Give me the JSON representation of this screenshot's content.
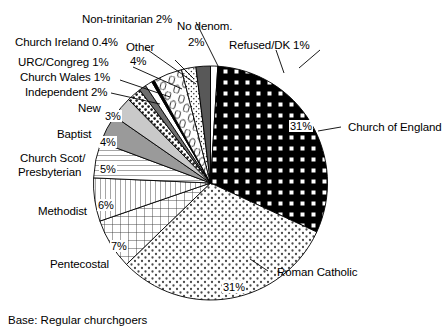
{
  "chart_data": {
    "type": "pie",
    "title": "",
    "subtitle": "",
    "caption": "Base: Regular churchgoers",
    "xlabel": "",
    "ylabel": "",
    "legend_position": "callout-labels",
    "grid": false,
    "total_percent": 100,
    "start_angle_deg": 0,
    "direction": "clockwise",
    "categories": [
      "Refused/DK",
      "Church of England",
      "Roman Catholic",
      "Pentecostal",
      "Methodist",
      "Church Scot/ Presbyterian",
      "Baptist",
      "New",
      "Independent",
      "Church Wales",
      "URC/Congreg",
      "Church Ireland",
      "Other",
      "Non-trinitarian",
      "No denom."
    ],
    "values": [
      1,
      31,
      31,
      7,
      6,
      5,
      4,
      3,
      2,
      1,
      1,
      0.4,
      4,
      2,
      2
    ],
    "value_labels": [
      "1%",
      "31%",
      "31%",
      "7%",
      "6%",
      "5%",
      "4%",
      "3%",
      "2%",
      "1%",
      "1%",
      "0.4%",
      "4%",
      "2%",
      "2%"
    ],
    "slices": [
      {
        "name": "Refused/DK",
        "value": 1,
        "label": "Refused/DK 1%",
        "pct_text": "1%",
        "pattern": "white",
        "fill": "#ffffff"
      },
      {
        "name": "Church of England",
        "value": 31,
        "label": "Church of England",
        "pct_text": "31%",
        "pattern": "black-white-squares",
        "fill": "#000000"
      },
      {
        "name": "Roman Catholic",
        "value": 31,
        "label": "Roman Catholic",
        "pct_text": "31%",
        "pattern": "stipple-dots",
        "fill": "#ffffff"
      },
      {
        "name": "Pentecostal",
        "value": 7,
        "label": "Pentecostal",
        "pct_text": "7%",
        "pattern": "cross-hatch",
        "fill": "#ffffff"
      },
      {
        "name": "Methodist",
        "value": 6,
        "label": "Methodist",
        "pct_text": "6%",
        "pattern": "vertical-lines",
        "fill": "#ffffff"
      },
      {
        "name": "Church Scot/ Presbyterian",
        "value": 5,
        "label": "Church Scot/ Presbyterian",
        "pct_text": "5%",
        "pattern": "horizontal-lines",
        "fill": "#ffffff"
      },
      {
        "name": "Baptist",
        "value": 4,
        "label": "Baptist",
        "pct_text": "4%",
        "pattern": "solid-grey",
        "fill": "#9a9a9a"
      },
      {
        "name": "New",
        "value": 3,
        "label": "New",
        "pct_text": "3%",
        "pattern": "solid-light-grey",
        "fill": "#c9c9c9"
      },
      {
        "name": "Independent",
        "value": 2,
        "label": "Independent 2%",
        "pct_text": "2%",
        "pattern": "coarse-dots",
        "fill": "#ffffff"
      },
      {
        "name": "Church Wales",
        "value": 1,
        "label": "Church Wales 1%",
        "pct_text": "1%",
        "pattern": "solid-dark-grey",
        "fill": "#6e6e6e"
      },
      {
        "name": "URC/Congreg",
        "value": 1,
        "label": "URC/Congreg 1%",
        "pct_text": "1%",
        "pattern": "white",
        "fill": "#ffffff"
      },
      {
        "name": "Church Ireland",
        "value": 0.4,
        "label": "Church Ireland 0.4%",
        "pct_text": "0.4%",
        "pattern": "solid-black",
        "fill": "#000000"
      },
      {
        "name": "Other",
        "value": 4,
        "label": "Other",
        "pct_text": "4%",
        "pattern": "squiggles",
        "fill": "#ffffff"
      },
      {
        "name": "Non-trinitarian",
        "value": 2,
        "label": "Non-trinitarian 2%",
        "pct_text": "2%",
        "pattern": "fine-dots",
        "fill": "#ffffff"
      },
      {
        "name": "No denom.",
        "value": 2,
        "label": "No denom.",
        "pct_text": "2%",
        "pattern": "solid-dark-grey",
        "fill": "#585858"
      }
    ]
  },
  "labels": {
    "non_trinitarian": "Non-trinitarian 2%",
    "no_denom_line1": "No denom.",
    "no_denom_line2": "2%",
    "refused_dk": "Refused/DK 1%",
    "church_ireland": "Church Ireland 0.4%",
    "other_line1": "Other",
    "other_line2": "4%",
    "urc_congreg": "URC/Congreg 1%",
    "church_wales": "Church Wales 1%",
    "independent": "Independent 2%",
    "new": "New",
    "baptist": "Baptist",
    "church_scot_line1": "Church Scot/",
    "church_scot_line2": "Presbyterian",
    "methodist": "Methodist",
    "pentecostal": "Pentecostal",
    "church_of_england": "Church of England",
    "roman_catholic": "Roman Catholic"
  },
  "percents": {
    "new": "3%",
    "baptist": "4%",
    "church_scot": "5%",
    "methodist": "6%",
    "pentecostal": "7%",
    "roman_catholic": "31%",
    "church_of_england": "31%"
  },
  "caption": "Base: Regular churchgoers"
}
